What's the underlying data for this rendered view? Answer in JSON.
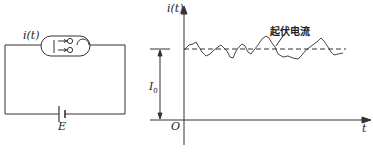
{
  "circuit": {
    "current_label": "i(t)",
    "battery_label": "E"
  },
  "graph": {
    "y_axis_label": "i(t)",
    "x_axis_label": "t",
    "origin_label": "O",
    "mean_label": "I",
    "mean_subscript": "0",
    "curve_annotation": "起伏电流"
  },
  "colors": {
    "line": "#333333",
    "background": "#ffffff"
  }
}
